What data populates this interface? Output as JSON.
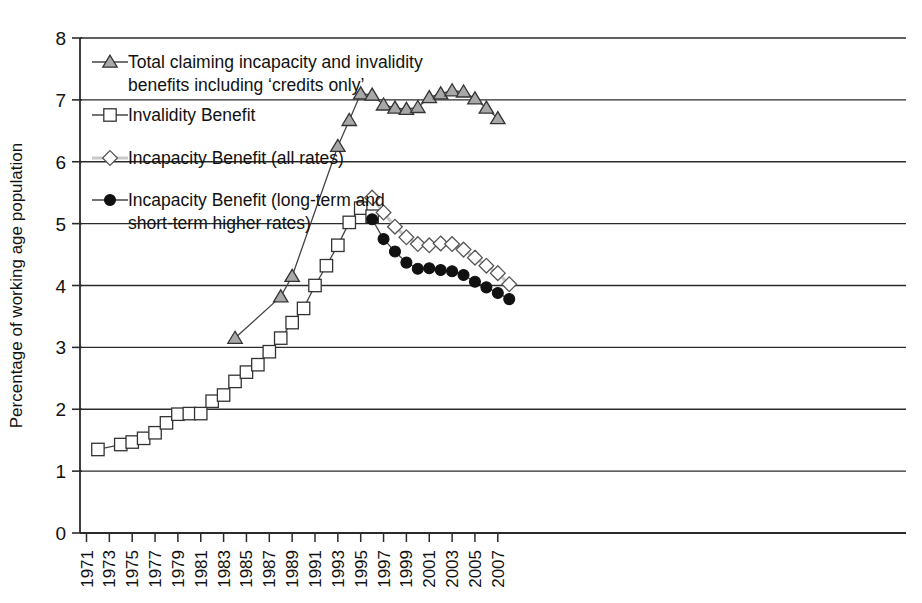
{
  "figure": {
    "background_color": "#ffffff",
    "ink_color": "#1a1a1a"
  },
  "axes": {
    "y_title": "Percentage of working age population",
    "x_title": "",
    "y_ticks": [
      "0",
      "1",
      "2",
      "3",
      "4",
      "5",
      "6",
      "7",
      "8"
    ],
    "x_ticks": [
      "1971",
      "1973",
      "1975",
      "1977",
      "1979",
      "1981",
      "1983",
      "1985",
      "1987",
      "1989",
      "1991",
      "1993",
      "1995",
      "1997",
      "1999",
      "2001",
      "2003",
      "2005",
      "2007"
    ]
  },
  "legend": {
    "items": [
      {
        "marker": "triangle-marker",
        "marker_fill": "#a8a8a8",
        "marker_stroke": "#333333",
        "line_color": "#444444",
        "label_line1": "Total claiming incapacity and invalidity",
        "label_line2": "benefits including ‘credits only’"
      },
      {
        "marker": "square-marker",
        "marker_fill": "#ffffff",
        "marker_stroke": "#333333",
        "line_color": "#444444",
        "label_line1": "Invalidity Benefit",
        "label_line2": ""
      },
      {
        "marker": "diamond-marker",
        "marker_fill": "#ffffff",
        "marker_stroke": "#555555",
        "line_color": "#c9c9c9",
        "label_line1": "Incapacity Benefit (all rates)",
        "label_line2": ""
      },
      {
        "marker": "circle-marker",
        "marker_fill": "#111111",
        "marker_stroke": "#111111",
        "line_color": "#444444",
        "label_line1": "Incapacity Benefit (long-term and",
        "label_line2": "short-term higher rates)"
      }
    ]
  },
  "chart_data": {
    "type": "line",
    "title": "",
    "xlabel": "",
    "ylabel": "Percentage of working age population",
    "xlim": [
      1971,
      2008
    ],
    "ylim": [
      0,
      8
    ],
    "grid": "horizontal",
    "legend_position": "upper-left-inside",
    "x_tick_step": 2,
    "x_tick_rotation": -90,
    "series": [
      {
        "name": "Total claiming incapacity and invalidity benefits including 'credits only'",
        "marker": "triangle",
        "marker_fill": "#a8a8a8",
        "line_color": "#444444",
        "x": [
          1984,
          1988,
          1989,
          1993,
          1994,
          1995,
          1996,
          1997,
          1998,
          1999,
          2000,
          2001,
          2002,
          2003,
          2004,
          2005,
          2006,
          2007
        ],
        "y": [
          3.15,
          3.82,
          4.15,
          6.25,
          6.67,
          7.1,
          7.08,
          6.92,
          6.87,
          6.85,
          6.88,
          7.04,
          7.1,
          7.15,
          7.13,
          7.02,
          6.87,
          6.7
        ]
      },
      {
        "name": "Invalidity Benefit",
        "marker": "square",
        "marker_fill": "#ffffff",
        "line_color": "#444444",
        "x": [
          1972,
          1974,
          1975,
          1976,
          1977,
          1978,
          1979,
          1980,
          1981,
          1982,
          1983,
          1984,
          1985,
          1986,
          1987,
          1988,
          1989,
          1990,
          1991,
          1992,
          1993,
          1994,
          1995,
          1996
        ],
        "y": [
          1.35,
          1.43,
          1.47,
          1.53,
          1.62,
          1.78,
          1.92,
          1.93,
          1.93,
          2.13,
          2.23,
          2.45,
          2.6,
          2.72,
          2.93,
          3.15,
          3.4,
          3.63,
          4.0,
          4.32,
          4.65,
          5.02,
          5.25,
          5.12
        ]
      },
      {
        "name": "Incapacity Benefit (all rates)",
        "marker": "diamond",
        "marker_fill": "#ffffff",
        "line_color": "#c9c9c9",
        "x": [
          1996,
          1997,
          1998,
          1999,
          2000,
          2001,
          2002,
          2003,
          2004,
          2005,
          2006,
          2007,
          2008
        ],
        "y": [
          5.42,
          5.18,
          4.95,
          4.78,
          4.67,
          4.65,
          4.68,
          4.67,
          4.58,
          4.45,
          4.32,
          4.2,
          4.02
        ]
      },
      {
        "name": "Incapacity Benefit (long-term and short-term higher rates)",
        "marker": "circle",
        "marker_fill": "#111111",
        "line_color": "#444444",
        "x": [
          1996,
          1997,
          1998,
          1999,
          2000,
          2001,
          2002,
          2003,
          2004,
          2005,
          2006,
          2007,
          2008
        ],
        "y": [
          5.07,
          4.75,
          4.55,
          4.37,
          4.27,
          4.28,
          4.25,
          4.23,
          4.17,
          4.06,
          3.97,
          3.88,
          3.78
        ]
      }
    ]
  }
}
